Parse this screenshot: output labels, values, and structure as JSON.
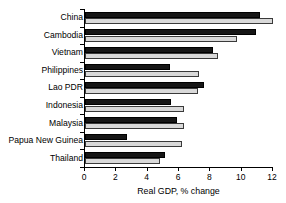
{
  "chart_data": {
    "type": "bar",
    "orientation": "horizontal",
    "title": "",
    "xlabel": "Real GDP, % change",
    "ylabel": "",
    "xlim": [
      0,
      12
    ],
    "xticks": [
      0,
      2,
      4,
      6,
      8,
      10,
      12
    ],
    "xticklabels": [
      "0",
      "2",
      "4",
      "6",
      "8",
      "10",
      "12"
    ],
    "grid": false,
    "legend": "none",
    "categories": [
      "China",
      "Cambodia",
      "Vietnam",
      "Philippines",
      "Lao PDR",
      "Indonesia",
      "Malaysia",
      "Papua New Guinea",
      "Thailand"
    ],
    "series": [
      {
        "name": "dark-series",
        "color": "#161616",
        "values": [
          11.2,
          10.9,
          8.2,
          5.4,
          7.6,
          5.5,
          5.9,
          2.7,
          5.1
        ]
      },
      {
        "name": "light-series",
        "color": "#d9d9d9",
        "values": [
          12.0,
          9.7,
          8.5,
          7.3,
          7.2,
          6.3,
          6.3,
          6.2,
          4.8
        ]
      }
    ]
  },
  "colors": {
    "dark_bar": "#161616",
    "light_bar": "#d9d9d9",
    "axis": "#000000",
    "background": "#ffffff"
  }
}
